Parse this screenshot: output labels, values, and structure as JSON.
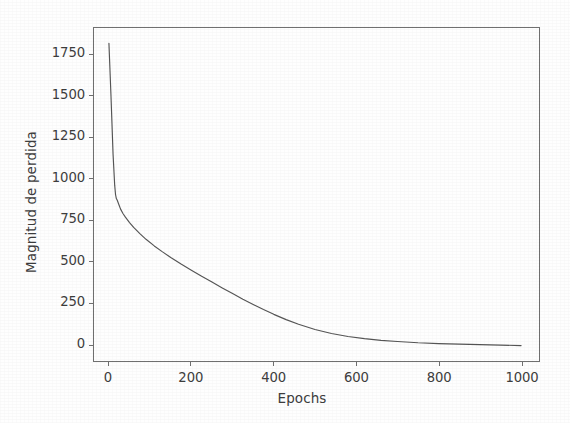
{
  "chart_data": {
    "type": "line",
    "title": "",
    "xlabel": "Epochs",
    "ylabel": "Magnitud de perdida",
    "xlim": [
      -45,
      1065
    ],
    "ylim": [
      -130,
      1990
    ],
    "xticks": [
      0,
      200,
      400,
      600,
      800,
      1000
    ],
    "xtick_labels": [
      "0",
      "200",
      "400",
      "600",
      "800",
      "1000"
    ],
    "yticks": [
      0,
      250,
      500,
      750,
      1000,
      1250,
      1500,
      1750
    ],
    "ytick_labels": [
      "0",
      "250",
      "500",
      "750",
      "1000",
      "1250",
      "1500",
      "1750"
    ],
    "grid": false,
    "legend": null,
    "line_color": "#555555",
    "axis_color": "#707070",
    "background_color": "#FEFEFE",
    "series": [
      {
        "name": "perdida",
        "x": [
          0,
          5,
          10,
          14,
          16,
          18,
          20,
          24,
          28,
          34,
          40,
          50,
          60,
          75,
          90,
          110,
          130,
          150,
          175,
          200,
          225,
          250,
          275,
          300,
          325,
          350,
          375,
          400,
          430,
          460,
          500,
          540,
          580,
          620,
          660,
          700,
          750,
          800,
          850,
          900,
          950,
          1000
        ],
        "y": [
          1820,
          1500,
          1150,
          960,
          905,
          880,
          872,
          845,
          818,
          790,
          768,
          735,
          706,
          668,
          634,
          594,
          558,
          524,
          484,
          447,
          410,
          375,
          340,
          306,
          272,
          240,
          209,
          180,
          148,
          120,
          88,
          64,
          46,
          33,
          23,
          16,
          8,
          3,
          0,
          -3,
          -6,
          -9
        ]
      }
    ]
  }
}
